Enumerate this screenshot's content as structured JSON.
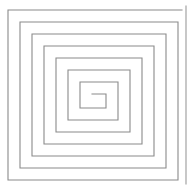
{
  "figure": {
    "name": "square-spiral",
    "title": "Rectangular spiral line drawing",
    "background_color": "#ffffff",
    "canvas": {
      "width": 191,
      "height": 190
    }
  },
  "chart_data": {
    "type": "line",
    "title": "Rectangular spiral line drawing",
    "xlabel": "",
    "ylabel": "",
    "grid": false,
    "legend": false,
    "xlim": [
      0,
      191
    ],
    "ylim": [
      0,
      190
    ],
    "series": [
      {
        "name": "spiral",
        "stroke_color": "#8a8a8a",
        "stroke_width": 1.1,
        "closed": false,
        "turns": 7,
        "winding": "clockwise-inward",
        "start_point": [
          182,
          10
        ],
        "end_point": [
          92,
          94
        ],
        "points": [
          [
            182,
            10
          ],
          [
            8,
            10
          ],
          [
            8,
            180
          ],
          [
            178,
            180
          ],
          [
            178,
            22
          ],
          [
            20,
            22
          ],
          [
            20,
            168
          ],
          [
            166,
            168
          ],
          [
            166,
            34
          ],
          [
            32,
            34
          ],
          [
            32,
            156
          ],
          [
            154,
            156
          ],
          [
            154,
            46
          ],
          [
            44,
            46
          ],
          [
            44,
            144
          ],
          [
            142,
            144
          ],
          [
            142,
            58
          ],
          [
            56,
            58
          ],
          [
            56,
            132
          ],
          [
            130,
            132
          ],
          [
            130,
            70
          ],
          [
            68,
            70
          ],
          [
            68,
            120
          ],
          [
            118,
            120
          ],
          [
            118,
            82
          ],
          [
            80,
            82
          ],
          [
            80,
            108
          ],
          [
            106,
            108
          ],
          [
            106,
            94
          ],
          [
            92,
            94
          ]
        ]
      },
      {
        "name": "right-edge-rule",
        "stroke_color": "#9a9a9a",
        "stroke_width": 1.1,
        "closed": false,
        "points": [
          [
            186,
            6
          ],
          [
            186,
            184
          ]
        ]
      }
    ]
  }
}
